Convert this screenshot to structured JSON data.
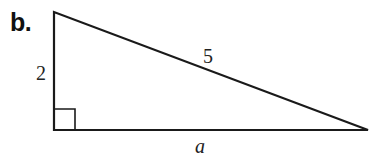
{
  "problem_label": "b.",
  "triangle": {
    "type": "right-triangle",
    "vertices": {
      "top": [
        54,
        12
      ],
      "right_angle": [
        54,
        130
      ],
      "right": [
        368,
        130
      ]
    },
    "right_angle_marker_size": 21,
    "stroke_color": "#1a1a1a",
    "sides": {
      "vertical_leg": "2",
      "hypotenuse": "5",
      "horizontal_leg": "a"
    }
  }
}
